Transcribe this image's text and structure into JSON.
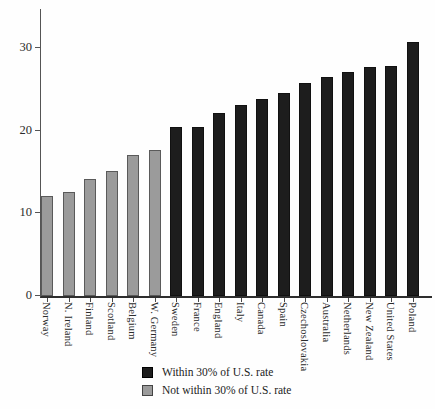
{
  "chart_data": {
    "type": "bar",
    "title": "",
    "xlabel": "",
    "ylabel": "",
    "categories": [
      "Norway",
      "N. Ireland",
      "Finland",
      "Scotland",
      "Belgium",
      "W. Germany",
      "Sweden",
      "France",
      "England",
      "Italy",
      "Canada",
      "Spain",
      "Czechoslovakia",
      "Australia",
      "Netherlands",
      "New Zealand",
      "United States",
      "Poland"
    ],
    "values": [
      12.1,
      12.6,
      14.2,
      15.1,
      17.0,
      17.7,
      20.4,
      20.4,
      22.1,
      23.1,
      23.8,
      24.6,
      25.8,
      26.5,
      27.1,
      27.7,
      27.8,
      30.7
    ],
    "within_30pct_of_us_rate": [
      false,
      false,
      false,
      false,
      false,
      false,
      true,
      true,
      true,
      true,
      true,
      true,
      true,
      true,
      true,
      true,
      true,
      true
    ],
    "yticks": [
      0,
      10,
      20,
      30
    ],
    "ylim": [
      0,
      34.7
    ],
    "grid": false,
    "legend_position": "bottom-center",
    "legend": [
      {
        "label": "Within 30% of U.S. rate",
        "color": "#1d1d1d"
      },
      {
        "label": "Not within 30% of U.S. rate",
        "color": "#9b9b9b"
      }
    ]
  },
  "colors": {
    "bar_within": "#1d1d1d",
    "bar_not_within": "#9b9b9b",
    "bar_gray_border": "#5a5a5a",
    "axis": "#2e2e2e",
    "text": "#2b2b2b",
    "background": "#fefefe"
  }
}
